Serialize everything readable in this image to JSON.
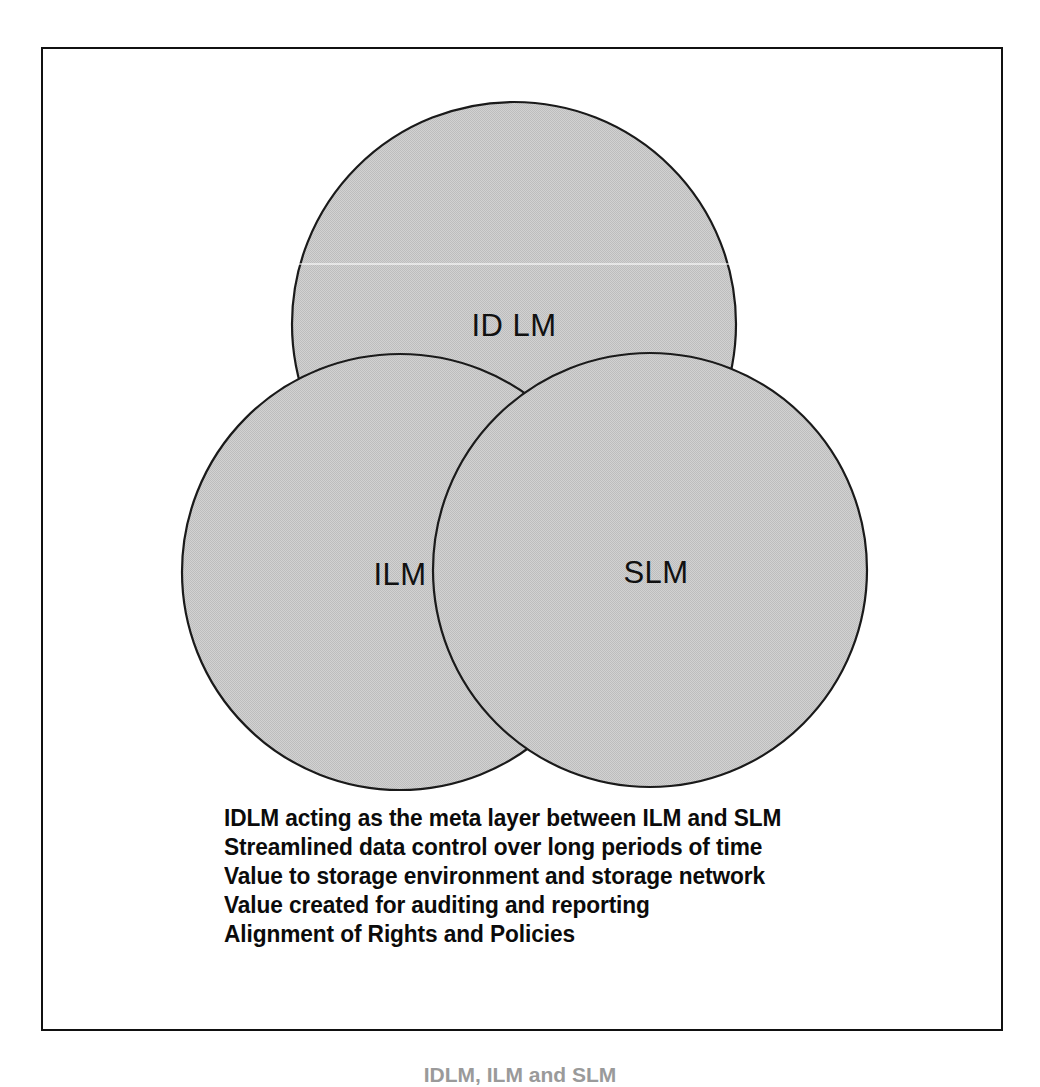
{
  "figure": {
    "type": "venn-diagram",
    "background_color": "#ffffff",
    "frame_color": "#111111",
    "circle_fill_color": "#c8c8c8",
    "circle_stroke_color": "#1a1a1a",
    "circles": [
      {
        "id": "idlm",
        "label": "ID LM",
        "cx": 471,
        "cy": 275,
        "r": 222
      },
      {
        "id": "ilm",
        "label": "ILM",
        "cx": 357,
        "cy": 523,
        "r": 218
      },
      {
        "id": "slm",
        "label": "SLM",
        "cx": 607,
        "cy": 521,
        "r": 217
      }
    ]
  },
  "bullets": {
    "lines": [
      "IDLM acting as the meta layer between ILM and SLM",
      "Streamlined data control over long periods of time",
      "Value to storage environment and storage network",
      "Value created for auditing and reporting",
      "Alignment of Rights and Policies"
    ]
  },
  "caption": {
    "text": "IDLM, ILM and SLM"
  }
}
